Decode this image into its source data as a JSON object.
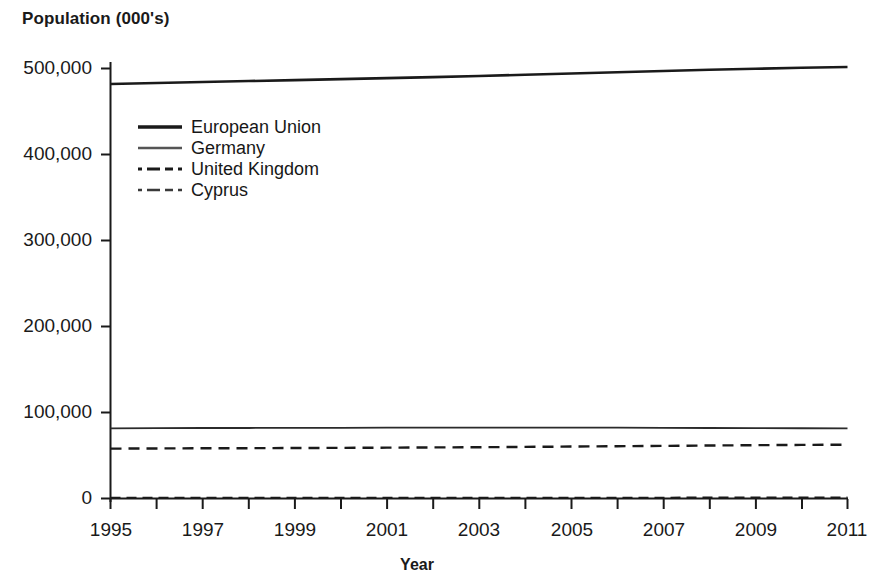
{
  "chart_data": {
    "type": "line",
    "title": "",
    "ylabel": "Population (000's)",
    "xlabel": "Year",
    "grid": false,
    "legend_position": "upper-left-inside",
    "xlim": [
      1995,
      2011
    ],
    "ylim": [
      0,
      500000
    ],
    "x": [
      1995,
      1996,
      1997,
      1998,
      1999,
      2000,
      2001,
      2002,
      2003,
      2004,
      2005,
      2006,
      2007,
      2008,
      2009,
      2010,
      2011
    ],
    "y_ticks": [
      0,
      100000,
      200000,
      300000,
      400000,
      500000
    ],
    "y_tick_labels": [
      "0",
      "100,000",
      "200,000",
      "300,000",
      "400,000",
      "500,000"
    ],
    "x_ticks": [
      1995,
      1996,
      1997,
      1998,
      1999,
      2000,
      2001,
      2002,
      2003,
      2004,
      2005,
      2006,
      2007,
      2008,
      2009,
      2010,
      2011
    ],
    "x_tick_labels": [
      "1995",
      "",
      "1997",
      "",
      "1999",
      "",
      "2001",
      "",
      "2003",
      "",
      "2005",
      "",
      "2007",
      "",
      "2009",
      "",
      "2011"
    ],
    "series": [
      {
        "name": "European Union",
        "style": "solid",
        "width": 2.6,
        "color": "#1a1a1a",
        "values": [
          482000,
          483200,
          484300,
          485400,
          486500,
          487600,
          488800,
          490000,
          491300,
          492700,
          494100,
          495600,
          497100,
          498500,
          499700,
          500800,
          501800
        ]
      },
      {
        "name": "Germany",
        "style": "solid",
        "width": 1.8,
        "color": "#2b2b2b",
        "values": [
          81500,
          81800,
          82000,
          82000,
          82100,
          82200,
          82300,
          82400,
          82500,
          82500,
          82400,
          82300,
          82200,
          82000,
          81800,
          81700,
          81500
        ]
      },
      {
        "name": "United Kingdom",
        "style": "dashed",
        "width": 2.4,
        "color": "#1a1a1a",
        "values": [
          58000,
          58200,
          58400,
          58500,
          58700,
          58900,
          59100,
          59400,
          59600,
          60000,
          60400,
          60800,
          61200,
          61600,
          62000,
          62300,
          62600
        ]
      },
      {
        "name": "Cyprus",
        "style": "dash-dot",
        "width": 2.2,
        "color": "#1a1a1a",
        "values": [
          740,
          750,
          760,
          770,
          780,
          790,
          800,
          810,
          820,
          840,
          860,
          880,
          900,
          920,
          940,
          960,
          980
        ]
      }
    ]
  },
  "axes": {
    "y_title": "Population (000's)",
    "x_title": "Year"
  },
  "legend": {
    "items": [
      {
        "label": "European Union",
        "swatch": "line-solid-thick-icon"
      },
      {
        "label": "Germany",
        "swatch": "line-solid-thin-icon"
      },
      {
        "label": "United Kingdom",
        "swatch": "line-dashdot-thick-icon"
      },
      {
        "label": "Cyprus",
        "swatch": "line-dashdot-thin-icon"
      }
    ]
  },
  "ticks": {
    "y": [
      "500,000",
      "400,000",
      "300,000",
      "200,000",
      "100,000",
      "0"
    ],
    "x": [
      "1995",
      "1997",
      "1999",
      "2001",
      "2003",
      "2005",
      "2007",
      "2009",
      "2011"
    ]
  }
}
